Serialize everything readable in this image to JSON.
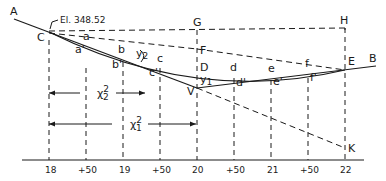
{
  "elevation_label": "El. 348.52",
  "points": {
    "A": "A",
    "B": "B",
    "C": "C",
    "D": "D",
    "E": "E",
    "F": "F",
    "G": "G",
    "H": "H",
    "K": "K",
    "V": "V",
    "a": "a",
    "b": "b",
    "c": "c",
    "d": "d",
    "e": "e",
    "f": "f",
    "a1": "a'",
    "b1": "b'",
    "c1": "c'",
    "d1": "d'",
    "e1": "e'",
    "f1": "f'"
  },
  "offsets": {
    "y1": "y",
    "y1_sub": "1",
    "y2": "y",
    "y2_sub": "2"
  },
  "distances": {
    "x2": "χ",
    "x2_sup": "2",
    "x2_sub": "2",
    "x1": "χ",
    "x1_sup": "2",
    "x1_sub": "1"
  },
  "stations": [
    "18",
    "+50",
    "19",
    "+50",
    "20",
    "+50",
    "21",
    "+50",
    "22"
  ],
  "colors": {
    "ink": "#1a1a1a",
    "background": "#ffffff"
  }
}
